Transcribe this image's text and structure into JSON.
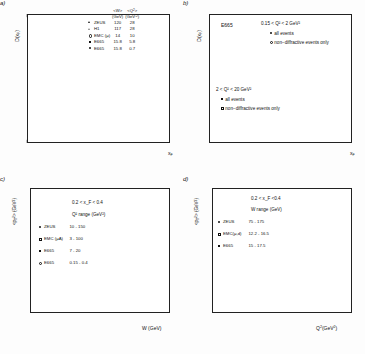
{
  "figure": {
    "panels": [
      "a",
      "b",
      "c",
      "d"
    ]
  },
  "panel_a": {
    "id_label": "a)",
    "ylabel": "D(x_F)",
    "xlabel": "x_F",
    "legend_header": {
      "col1_line1": "<W>",
      "col1_line2": "(GeV)",
      "col2_line1": "<Q²>",
      "col2_line2": "(GeV⁻²)"
    },
    "legend_rows": [
      {
        "marker": "tri",
        "name": "ZEUS",
        "w": "120",
        "q2": "28"
      },
      {
        "marker": "otri",
        "name": "H1",
        "w": "117",
        "q2": "28"
      },
      {
        "marker": "ocir",
        "name": "EMC (μ)",
        "w": "14",
        "q2": "10"
      },
      {
        "marker": "sq",
        "name": "E665",
        "w": "15.8",
        "q2": "5.8"
      },
      {
        "marker": "dot",
        "name": "E665",
        "w": "15.8",
        "q2": "0.7"
      }
    ],
    "yticks": [
      "10",
      "1",
      "10",
      "10"
    ],
    "xticks": [
      "0",
      "0.1",
      "0.2",
      "0.3",
      "0.4",
      "0.5",
      "0.6",
      "0.7",
      "0.8",
      "0.9",
      "1"
    ]
  },
  "panel_b": {
    "id_label": "b)",
    "ylabel": "D(x_F)",
    "xlabel": "x_F",
    "experiment": "E665",
    "group_top": {
      "range": "0.15 < Q² < 2 GeV²",
      "items": [
        {
          "marker": "dot",
          "label": "all events"
        },
        {
          "marker": "ocir",
          "label": "non−diffractive events only"
        }
      ]
    },
    "group_bottom": {
      "range": "2 < Q² < 20 GeV²",
      "items": [
        {
          "marker": "sq",
          "label": "all events"
        },
        {
          "marker": "osq",
          "label": "non−diffractive events only"
        }
      ]
    },
    "xticks": [
      "0",
      "0.1",
      "0.2",
      "0.3",
      "0.4",
      "0.5",
      "0.6",
      "0.7",
      "0.8",
      "0.9",
      "1"
    ]
  },
  "panel_c": {
    "id_label": "c)",
    "ylabel": "<p_T²> (GeV²)",
    "xlabel": "W (GeV)",
    "anno_xf": "0.2 < x_F < 0.4",
    "anno_range": "Q² range (GeV²)",
    "legend_rows": [
      {
        "marker": "dot",
        "name": "ZEUS",
        "range": "10 - 150"
      },
      {
        "marker": "osq",
        "name": "EMC (μA)",
        "range": "3 - 100"
      },
      {
        "marker": "sq",
        "name": "E665",
        "range": "7 - 20"
      },
      {
        "marker": "ocir",
        "name": "E665",
        "range": "0.15 - 0.4"
      }
    ],
    "yticks": [
      "0",
      "0.2",
      "0.4",
      "0.6",
      "0.8",
      "1",
      "1.2",
      "1.4",
      "1.6",
      "1.8",
      "2"
    ],
    "xticks": [
      "1",
      "100"
    ]
  },
  "panel_d": {
    "id_label": "d)",
    "ylabel": "<p_T²> (GeV²)",
    "xlabel": "Q²(GeV²)",
    "anno_xf": "0.2 < x_F <0.4",
    "anno_range": "W range (GeV)",
    "legend_rows": [
      {
        "marker": "dot",
        "name": "ZEUS",
        "range": "75 - 175"
      },
      {
        "marker": "osq",
        "name": "EMC(μ,d)",
        "range": "12.2 - 16.5"
      },
      {
        "marker": "sq",
        "name": "E665",
        "range": "15 - 17.5"
      }
    ],
    "yticks": [
      "0",
      "0.5",
      "1",
      "1.5",
      "2",
      "2.5"
    ],
    "xticks": [
      "1",
      "10",
      "100"
    ]
  },
  "chart_data": [
    {
      "type": "scatter",
      "panel": "a",
      "title": "",
      "xlabel": "x_F",
      "ylabel": "D(x_F)",
      "xscale": "linear",
      "yscale": "log",
      "xlim": [
        0,
        1
      ],
      "ylim": [
        0.001,
        60
      ],
      "grid": false,
      "legend_position": "top-right",
      "series": [
        {
          "name": "ZEUS",
          "marker": "triangle",
          "W_GeV": 120,
          "Q2_GeV2": 28,
          "x": [
            0.025,
            0.05,
            0.075,
            0.1,
            0.125,
            0.15,
            0.2,
            0.25,
            0.3,
            0.35,
            0.4,
            0.45,
            0.5,
            0.55,
            0.6,
            0.65,
            0.7,
            0.75,
            0.8,
            0.85
          ],
          "y": [
            24,
            18,
            14,
            11,
            9,
            7.5,
            5.2,
            3.6,
            2.6,
            1.9,
            1.3,
            0.9,
            0.62,
            0.42,
            0.3,
            0.2,
            0.15,
            0.1,
            0.07,
            0.05
          ]
        },
        {
          "name": "H1",
          "marker": "open-triangle",
          "W_GeV": 117,
          "Q2_GeV2": 28,
          "x": [
            0.03,
            0.06,
            0.09,
            0.13,
            0.18,
            0.23,
            0.28,
            0.33,
            0.38,
            0.45,
            0.52,
            0.6,
            0.68,
            0.75
          ],
          "y": [
            20,
            15,
            11,
            8.5,
            6.0,
            4.2,
            3.0,
            2.1,
            1.5,
            0.95,
            0.6,
            0.34,
            0.19,
            0.12
          ]
        },
        {
          "name": "EMC (mu)",
          "marker": "open-circle",
          "W_GeV": 14,
          "Q2_GeV2": 10,
          "x": [
            0.05,
            0.1,
            0.15,
            0.2,
            0.25,
            0.3,
            0.35,
            0.4,
            0.45,
            0.5,
            0.55,
            0.6,
            0.65,
            0.7,
            0.75,
            0.8,
            0.85,
            0.9
          ],
          "y": [
            16,
            10,
            7.0,
            5.0,
            3.5,
            2.4,
            1.7,
            1.2,
            0.85,
            0.6,
            0.42,
            0.3,
            0.2,
            0.14,
            0.1,
            0.07,
            0.05,
            0.035
          ]
        },
        {
          "name": "E665 (Q2=5.8)",
          "marker": "filled-square",
          "W_GeV": 15.8,
          "Q2_GeV2": 5.8,
          "x": [
            0.04,
            0.09,
            0.14,
            0.19,
            0.24,
            0.3,
            0.36,
            0.42,
            0.48,
            0.54,
            0.6,
            0.66,
            0.72,
            0.78,
            0.84,
            0.9,
            0.95
          ],
          "y": [
            22,
            12,
            8.0,
            5.5,
            3.8,
            2.6,
            1.8,
            1.2,
            0.8,
            0.55,
            0.36,
            0.24,
            0.16,
            0.1,
            0.065,
            0.04,
            0.03
          ]
        },
        {
          "name": "E665 (Q2=0.7)",
          "marker": "filled-circle",
          "W_GeV": 15.8,
          "Q2_GeV2": 0.7,
          "x": [
            0.04,
            0.09,
            0.14,
            0.2,
            0.26,
            0.32,
            0.38,
            0.44,
            0.5,
            0.56,
            0.62,
            0.68,
            0.74,
            0.8,
            0.86,
            0.92,
            0.97
          ],
          "y": [
            26,
            14,
            9.0,
            6.0,
            4.0,
            2.8,
            1.9,
            1.3,
            0.9,
            0.6,
            0.4,
            0.27,
            0.18,
            0.12,
            0.08,
            0.05,
            0.033
          ]
        }
      ]
    },
    {
      "type": "scatter",
      "panel": "b",
      "title": "E665",
      "xlabel": "x_F",
      "ylabel": "D(x_F)",
      "xscale": "linear",
      "yscale": "log",
      "xlim": [
        0,
        1
      ],
      "ylim": [
        0.001,
        60
      ],
      "grid": false,
      "legend_position": "upper-right",
      "series": [
        {
          "name": "0.15<Q2<2 all events",
          "marker": "filled-circle",
          "x": [
            0.03,
            0.08,
            0.13,
            0.18,
            0.23,
            0.28,
            0.33,
            0.38,
            0.43,
            0.48,
            0.53,
            0.58,
            0.63,
            0.68,
            0.73,
            0.78,
            0.83,
            0.88,
            0.93,
            0.97
          ],
          "y": [
            26,
            13,
            8.5,
            5.8,
            4.0,
            2.8,
            2.0,
            1.4,
            1.0,
            0.72,
            0.52,
            0.38,
            0.27,
            0.19,
            0.135,
            0.095,
            0.07,
            0.05,
            0.038,
            0.028
          ]
        },
        {
          "name": "0.15<Q2<2 non-diffractive",
          "marker": "open-circle",
          "x": [
            0.48,
            0.58,
            0.68,
            0.78,
            0.88,
            0.93,
            0.97
          ],
          "y": [
            0.68,
            0.35,
            0.17,
            0.08,
            0.032,
            0.016,
            0.004
          ]
        },
        {
          "name": "2<Q2<20 all events",
          "marker": "filled-square",
          "x": [
            0.04,
            0.09,
            0.14,
            0.19,
            0.24,
            0.3,
            0.35,
            0.4,
            0.45,
            0.5,
            0.55,
            0.6,
            0.65,
            0.7,
            0.75,
            0.8,
            0.85,
            0.9,
            0.95
          ],
          "y": [
            24,
            12,
            8.0,
            5.4,
            3.7,
            2.5,
            1.8,
            1.25,
            0.9,
            0.65,
            0.46,
            0.33,
            0.23,
            0.16,
            0.11,
            0.078,
            0.055,
            0.04,
            0.03
          ]
        },
        {
          "name": "2<Q2<20 non-diffractive",
          "marker": "open-square",
          "x": [
            0.5,
            0.6,
            0.7,
            0.8,
            0.88
          ],
          "y": [
            0.6,
            0.3,
            0.15,
            0.065,
            0.03
          ]
        }
      ]
    },
    {
      "type": "scatter",
      "panel": "c",
      "title": "",
      "xlabel": "W (GeV)",
      "ylabel": "<p_T^2> (GeV^2)",
      "xscale": "log",
      "yscale": "linear",
      "xlim": [
        0.4,
        300
      ],
      "ylim": [
        0,
        2
      ],
      "grid": false,
      "annotations": [
        "0.2 < x_F < 0.4",
        "Q² range (GeV²)"
      ],
      "series": [
        {
          "name": "ZEUS",
          "marker": "filled-circle",
          "Q2_range": "10 - 150",
          "x": [
            85,
            120,
            150,
            200
          ],
          "y": [
            1.07,
            1.18,
            1.05,
            1.52
          ],
          "yerr": [
            0.13,
            0.12,
            0.18,
            0.2
          ]
        },
        {
          "name": "EMC (muA)",
          "marker": "open-square",
          "Q2_range": "3 - 100",
          "x": [
            0.6,
            1.2,
            1.6,
            2.2,
            3.0,
            4.2,
            5.5,
            7.5,
            10,
            13
          ],
          "y": [
            0.22,
            0.24,
            0.25,
            0.26,
            0.27,
            0.28,
            0.28,
            0.29,
            0.29,
            0.29
          ]
        },
        {
          "name": "E665 (7-20)",
          "marker": "filled-square",
          "Q2_range": "7 - 20",
          "x": [
            1.4,
            2.2,
            3.2,
            4.5,
            6.0,
            8.5,
            11,
            16
          ],
          "y": [
            0.25,
            0.3,
            0.32,
            0.34,
            0.36,
            0.4,
            0.42,
            0.48
          ],
          "yerr": [
            0.02,
            0.02,
            0.02,
            0.02,
            0.03,
            0.03,
            0.03,
            0.04
          ]
        },
        {
          "name": "E665 (0.15-0.4)",
          "marker": "open-circle",
          "Q2_range": "0.15 - 0.4",
          "x": [
            1.6,
            2.6,
            3.6,
            5.0,
            7.0,
            9.5,
            13
          ],
          "y": [
            0.27,
            0.31,
            0.33,
            0.35,
            0.37,
            0.4,
            0.43
          ]
        }
      ]
    },
    {
      "type": "scatter",
      "panel": "d",
      "title": "",
      "xlabel": "Q²(GeV²)",
      "ylabel": "<p_T^2> (GeV^2)",
      "xscale": "log",
      "yscale": "linear",
      "xlim": [
        0.2,
        300
      ],
      "ylim": [
        0,
        2.5
      ],
      "grid": false,
      "annotations": [
        "0.2 < x_F <0.4",
        "W range (GeV)"
      ],
      "series": [
        {
          "name": "ZEUS",
          "marker": "filled-circle",
          "W_range": "75 - 175",
          "x": [
            14,
            30,
            60,
            120
          ],
          "y": [
            1.03,
            1.27,
            1.45,
            2.1
          ],
          "yerr": [
            0.1,
            0.12,
            0.22,
            0.35
          ]
        },
        {
          "name": "EMC(mu,d)",
          "marker": "open-square",
          "W_range": "12.2 - 16.5",
          "x": [
            5.0,
            7.5,
            13,
            22,
            38,
            65
          ],
          "y": [
            0.3,
            0.29,
            0.31,
            0.3,
            0.29,
            0.3
          ]
        },
        {
          "name": "E665",
          "marker": "filled-square",
          "W_range": "15 - 17.5",
          "x": [
            0.3,
            0.55,
            0.95,
            2.1,
            4.5,
            9.0,
            18,
            34
          ],
          "y": [
            0.27,
            0.27,
            0.27,
            0.3,
            0.3,
            0.33,
            0.33,
            0.31
          ],
          "yerr": [
            0.02,
            0.02,
            0.02,
            0.02,
            0.04,
            0.03,
            0.03,
            0.03
          ]
        }
      ]
    }
  ]
}
